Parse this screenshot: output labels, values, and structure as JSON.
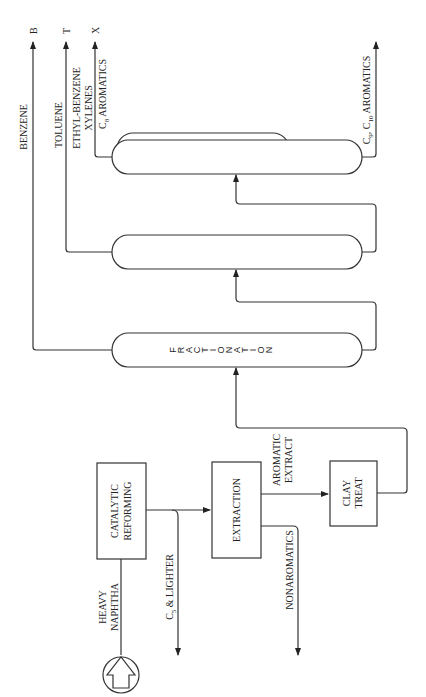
{
  "diagram": {
    "orientation": "rotated 90° counter-clockwise",
    "feed": {
      "label_line1": "HEAVY",
      "label_line2": "NAPHTHA",
      "icon": "feed-arrow-in-circle-icon"
    },
    "units": {
      "reforming": {
        "line1": "CATALYTIC",
        "line2": "REFORMING"
      },
      "extraction": {
        "label": "EXTRACTION"
      },
      "clay": {
        "line1": "CLAY",
        "line2": "TREAT"
      },
      "fractionation": {
        "letters": [
          "F",
          "R",
          "A",
          "C",
          "T",
          "I",
          "O",
          "N",
          "A",
          "T",
          "I",
          "O",
          "N"
        ]
      }
    },
    "streams": {
      "c5": {
        "prefix": "C",
        "sub": "5",
        "suffix": " & LIGHTER"
      },
      "nonaromatics": "NONAROMATICS",
      "aromatic_extract_line1": "AROMATIC",
      "aromatic_extract_line2": "EXTRACT",
      "benzene": "BENZENE",
      "toluene": "TOLUENE",
      "ethylbenzene": "ETHYL-BENZENE",
      "xylenes": "XYLENES",
      "c8": {
        "prefix": "C",
        "sub": "8",
        "suffix": " AROMATICS"
      },
      "c9c10": {
        "c9": "C",
        "c9sub": "9",
        "sep": ", C",
        "c10sub": "10",
        "suffix": " AROMATICS"
      }
    },
    "product_tags": {
      "benzene": "B",
      "toluene": "T",
      "xylene": "X"
    }
  }
}
